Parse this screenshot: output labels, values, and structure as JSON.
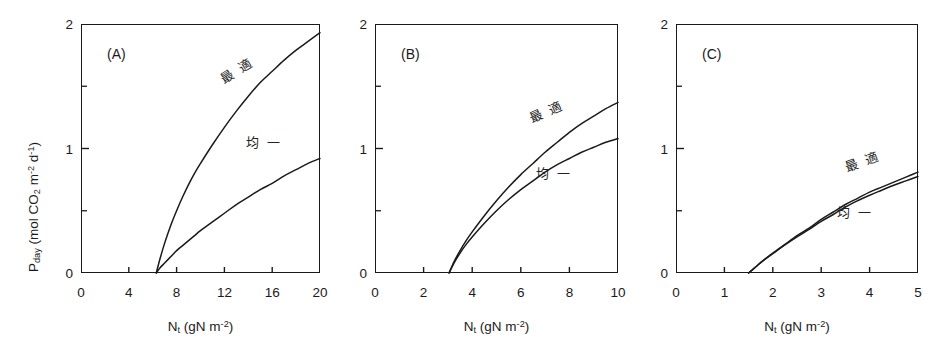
{
  "figure": {
    "background": "#ffffff",
    "ink": "#1a1a1a",
    "axis_title_y_prefix": "P",
    "axis_title_y_sub": "day",
    "axis_title_y_units_open": "  (mol CO",
    "axis_title_y_units_co2_sub": "2",
    "axis_title_y_units_m": " m",
    "axis_title_y_units_m_sup": "-2",
    "axis_title_y_units_d": " d",
    "axis_title_y_units_d_sup": "-1",
    "axis_title_y_units_close": ")",
    "axis_title_x_prefix": "N",
    "axis_title_x_sub": "t",
    "axis_title_x_units_open": "  (gN m",
    "axis_title_x_units_sup": "-2",
    "axis_title_x_units_close": ")",
    "y_tick_labels": [
      "0",
      "1",
      "2"
    ],
    "y_tick_values": [
      0,
      1,
      2
    ],
    "y_minor_tick_values": [
      0.5,
      1.5
    ],
    "curve_label_optimal": "最 適",
    "curve_label_uniform": "均 一"
  },
  "chart_data": {
    "type": "line",
    "title": "",
    "panels": [
      {
        "id": "A",
        "label": "(A)",
        "xlabel": "Nt (gN m-2)",
        "ylabel": "Pday (mol CO2 m-2 d-1)",
        "xlim": [
          0,
          20
        ],
        "ylim": [
          0,
          2
        ],
        "xticks": [
          0,
          4,
          8,
          12,
          16,
          20
        ],
        "xtick_labels": [
          "0",
          "4",
          "8",
          "12",
          "16",
          "20"
        ],
        "yticks": [
          0,
          1,
          2
        ],
        "ytick_labels": [
          "0",
          "1",
          "2"
        ],
        "y_minor_ticks": [
          0.5,
          1.5
        ],
        "grid": false,
        "legend_position": "inline-curve-labels",
        "x_intercept": 6.3,
        "series": [
          {
            "name": "最 適",
            "name_en": "optimal",
            "color": "#1a1a1a",
            "label_x": 13.0,
            "label_y": 1.63,
            "label_rotation": -32,
            "points": [
              [
                6.3,
                0.0
              ],
              [
                6.6,
                0.11
              ],
              [
                7.0,
                0.24
              ],
              [
                7.5,
                0.38
              ],
              [
                8.0,
                0.5
              ],
              [
                8.5,
                0.61
              ],
              [
                9.0,
                0.71
              ],
              [
                9.5,
                0.8
              ],
              [
                10.0,
                0.88
              ],
              [
                11.0,
                1.03
              ],
              [
                12.0,
                1.17
              ],
              [
                13.0,
                1.3
              ],
              [
                14.0,
                1.42
              ],
              [
                15.0,
                1.53
              ],
              [
                16.0,
                1.62
              ],
              [
                17.0,
                1.71
              ],
              [
                18.0,
                1.79
              ],
              [
                19.0,
                1.86
              ],
              [
                20.0,
                1.93
              ]
            ]
          },
          {
            "name": "均 一",
            "name_en": "uniform",
            "color": "#1a1a1a",
            "label_x": 15.3,
            "label_y": 1.06,
            "label_rotation": 0,
            "points": [
              [
                6.3,
                0.0
              ],
              [
                6.6,
                0.04
              ],
              [
                7.0,
                0.08
              ],
              [
                7.5,
                0.13
              ],
              [
                8.0,
                0.18
              ],
              [
                8.5,
                0.22
              ],
              [
                9.0,
                0.26
              ],
              [
                9.5,
                0.3
              ],
              [
                10.0,
                0.34
              ],
              [
                11.0,
                0.41
              ],
              [
                12.0,
                0.48
              ],
              [
                13.0,
                0.55
              ],
              [
                14.0,
                0.61
              ],
              [
                15.0,
                0.67
              ],
              [
                16.0,
                0.72
              ],
              [
                17.0,
                0.78
              ],
              [
                18.0,
                0.83
              ],
              [
                19.0,
                0.88
              ],
              [
                20.0,
                0.92
              ]
            ]
          }
        ]
      },
      {
        "id": "B",
        "label": "(B)",
        "xlabel": "Nt (gN m-2)",
        "ylabel": "",
        "xlim": [
          0,
          10
        ],
        "ylim": [
          0,
          2
        ],
        "xticks": [
          0,
          2,
          4,
          6,
          8,
          10
        ],
        "xtick_labels": [
          "0",
          "2",
          "4",
          "6",
          "8",
          "10"
        ],
        "yticks": [
          0,
          1,
          2
        ],
        "ytick_labels": [
          "0",
          "1",
          "2"
        ],
        "y_minor_ticks": [
          0.5,
          1.5
        ],
        "grid": false,
        "legend_position": "inline-curve-labels",
        "x_intercept": 3.05,
        "series": [
          {
            "name": "最 適",
            "name_en": "optimal",
            "color": "#1a1a1a",
            "label_x": 7.05,
            "label_y": 1.3,
            "label_rotation": -24,
            "points": [
              [
                3.05,
                0.0
              ],
              [
                3.25,
                0.09
              ],
              [
                3.5,
                0.18
              ],
              [
                3.75,
                0.26
              ],
              [
                4.0,
                0.33
              ],
              [
                4.5,
                0.46
              ],
              [
                5.0,
                0.58
              ],
              [
                5.5,
                0.69
              ],
              [
                6.0,
                0.79
              ],
              [
                6.5,
                0.88
              ],
              [
                7.0,
                0.97
              ],
              [
                7.5,
                1.05
              ],
              [
                8.0,
                1.13
              ],
              [
                8.5,
                1.2
              ],
              [
                9.0,
                1.26
              ],
              [
                9.5,
                1.32
              ],
              [
                10.0,
                1.37
              ]
            ]
          },
          {
            "name": "均 一",
            "name_en": "uniform",
            "color": "#1a1a1a",
            "label_x": 7.35,
            "label_y": 0.81,
            "label_rotation": 0,
            "points": [
              [
                3.05,
                0.0
              ],
              [
                3.25,
                0.08
              ],
              [
                3.5,
                0.16
              ],
              [
                3.75,
                0.23
              ],
              [
                4.0,
                0.29
              ],
              [
                4.5,
                0.4
              ],
              [
                5.0,
                0.5
              ],
              [
                5.5,
                0.59
              ],
              [
                6.0,
                0.67
              ],
              [
                6.5,
                0.74
              ],
              [
                7.0,
                0.81
              ],
              [
                7.5,
                0.87
              ],
              [
                8.0,
                0.92
              ],
              [
                8.5,
                0.97
              ],
              [
                9.0,
                1.01
              ],
              [
                9.5,
                1.05
              ],
              [
                10.0,
                1.08
              ]
            ]
          }
        ]
      },
      {
        "id": "C",
        "label": "(C)",
        "xlabel": "Nt (gN m-2)",
        "ylabel": "",
        "xlim": [
          0,
          5
        ],
        "ylim": [
          0,
          2
        ],
        "xticks": [
          0,
          1,
          2,
          3,
          4,
          5
        ],
        "xtick_labels": [
          "0",
          "1",
          "2",
          "3",
          "4",
          "5"
        ],
        "yticks": [
          0,
          1,
          2
        ],
        "ytick_labels": [
          "0",
          "1",
          "2"
        ],
        "y_minor_ticks": [
          0.5,
          1.5
        ],
        "grid": false,
        "legend_position": "inline-curve-labels",
        "x_intercept": 1.5,
        "series": [
          {
            "name": "最 適",
            "name_en": "optimal",
            "color": "#1a1a1a",
            "label_x": 3.85,
            "label_y": 0.9,
            "label_rotation": -20,
            "points": [
              [
                1.5,
                0.0
              ],
              [
                1.65,
                0.05
              ],
              [
                1.8,
                0.1
              ],
              [
                2.0,
                0.16
              ],
              [
                2.25,
                0.23
              ],
              [
                2.5,
                0.3
              ],
              [
                2.75,
                0.36
              ],
              [
                3.0,
                0.43
              ],
              [
                3.25,
                0.49
              ],
              [
                3.5,
                0.55
              ],
              [
                3.75,
                0.6
              ],
              [
                4.0,
                0.65
              ],
              [
                4.25,
                0.69
              ],
              [
                4.5,
                0.73
              ],
              [
                4.75,
                0.77
              ],
              [
                5.0,
                0.81
              ]
            ]
          },
          {
            "name": "均 一",
            "name_en": "uniform",
            "color": "#1a1a1a",
            "label_x": 3.7,
            "label_y": 0.5,
            "label_rotation": 0,
            "points": [
              [
                1.5,
                0.0
              ],
              [
                1.65,
                0.05
              ],
              [
                1.8,
                0.1
              ],
              [
                2.0,
                0.155
              ],
              [
                2.25,
                0.225
              ],
              [
                2.5,
                0.29
              ],
              [
                2.75,
                0.35
              ],
              [
                3.0,
                0.415
              ],
              [
                3.25,
                0.47
              ],
              [
                3.5,
                0.53
              ],
              [
                3.75,
                0.58
              ],
              [
                4.0,
                0.625
              ],
              [
                4.25,
                0.665
              ],
              [
                4.5,
                0.705
              ],
              [
                4.75,
                0.74
              ],
              [
                5.0,
                0.775
              ]
            ]
          }
        ]
      }
    ]
  }
}
